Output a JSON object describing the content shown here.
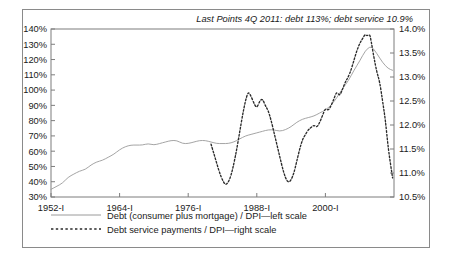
{
  "figure": {
    "title": "Last Points 4Q 2011: debt 113%; debt service 10.9%"
  },
  "chart_data": {
    "type": "line",
    "title": "Last Points 4Q 2011: debt 113%; debt service 10.9%",
    "xlabel": "",
    "ylabel": "",
    "grid": false,
    "legend_position": "bottom-left",
    "x_tick_labels": [
      "1952-I",
      "1964-I",
      "1976-I",
      "1988-I",
      "2000-I"
    ],
    "x_tick_years": [
      1952,
      1964,
      1976,
      1988,
      2000
    ],
    "xlim": [
      1952,
      2012
    ],
    "left_axis": {
      "label": "Debt (consumer plus mortgage) / DPI",
      "ylim": [
        30,
        140
      ],
      "tick_labels": [
        "30%",
        "40%",
        "50%",
        "60%",
        "70%",
        "80%",
        "90%",
        "100%",
        "110%",
        "120%",
        "130%",
        "140%"
      ],
      "ticks": [
        30,
        40,
        50,
        60,
        70,
        80,
        90,
        100,
        110,
        120,
        130,
        140
      ]
    },
    "right_axis": {
      "label": "Debt service payments / DPI",
      "ylim": [
        10.5,
        14.0
      ],
      "tick_labels": [
        "10.5%",
        "11.0%",
        "11.5%",
        "12.0%",
        "12.5%",
        "13.0%",
        "13.5%",
        "14.0%"
      ],
      "ticks": [
        10.5,
        11.0,
        11.5,
        12.0,
        12.5,
        13.0,
        13.5,
        14.0
      ]
    },
    "series": [
      {
        "name": "Debt (consumer plus mortgage) / DPI—left scale",
        "axis": "left",
        "style": "solid",
        "color": "#9a9a9a",
        "x": [
          1952,
          1953,
          1954,
          1955,
          1956,
          1957,
          1958,
          1959,
          1960,
          1961,
          1962,
          1963,
          1964,
          1965,
          1966,
          1967,
          1968,
          1969,
          1970,
          1971,
          1972,
          1973,
          1974,
          1975,
          1976,
          1977,
          1978,
          1979,
          1980,
          1981,
          1982,
          1983,
          1984,
          1985,
          1986,
          1987,
          1988,
          1989,
          1990,
          1991,
          1992,
          1993,
          1994,
          1995,
          1996,
          1997,
          1998,
          1999,
          2000,
          2001,
          2002,
          2003,
          2004,
          2005,
          2006,
          2007,
          2008,
          2009,
          2010,
          2011,
          2011.75
        ],
        "values": [
          35,
          37,
          39,
          43,
          45,
          47,
          48,
          51,
          53,
          54,
          56,
          58,
          61,
          63,
          64,
          64,
          64,
          65,
          64,
          65,
          66,
          67,
          67,
          65,
          65,
          66,
          67,
          67,
          66,
          65,
          65,
          65,
          66,
          68,
          70,
          71,
          72,
          73,
          74,
          74,
          73,
          74,
          76,
          79,
          81,
          82,
          83,
          85,
          87,
          90,
          95,
          101,
          106,
          113,
          119,
          126,
          129,
          124,
          118,
          114,
          113
        ]
      },
      {
        "name": "Debt service payments / DPI—right scale",
        "axis": "right",
        "style": "dashed",
        "color": "#2a2a2a",
        "x": [
          1980,
          1980.5,
          1981,
          1981.5,
          1982,
          1982.5,
          1983,
          1983.5,
          1984,
          1984.5,
          1985,
          1985.5,
          1986,
          1986.5,
          1987,
          1987.5,
          1988,
          1988.5,
          1989,
          1989.5,
          1990,
          1990.5,
          1991,
          1991.5,
          1992,
          1992.5,
          1993,
          1993.5,
          1994,
          1994.5,
          1995,
          1995.5,
          1996,
          1996.5,
          1997,
          1997.5,
          1998,
          1998.5,
          1999,
          1999.5,
          2000,
          2000.5,
          2001,
          2001.5,
          2002,
          2002.5,
          2003,
          2003.5,
          2004,
          2004.5,
          2005,
          2005.5,
          2006,
          2006.5,
          2007,
          2007.25,
          2007.75,
          2008,
          2008.5,
          2009,
          2009.5,
          2010,
          2010.5,
          2011,
          2011.75
        ],
        "values": [
          11.6,
          11.4,
          11.2,
          11.0,
          10.85,
          10.75,
          10.8,
          10.95,
          11.2,
          11.5,
          11.85,
          12.2,
          12.5,
          12.7,
          12.6,
          12.45,
          12.35,
          12.5,
          12.55,
          12.4,
          12.3,
          12.1,
          11.85,
          11.6,
          11.35,
          11.1,
          10.9,
          10.8,
          10.85,
          11.0,
          11.25,
          11.5,
          11.7,
          11.8,
          11.9,
          11.95,
          12.0,
          11.95,
          12.05,
          12.2,
          12.35,
          12.3,
          12.4,
          12.55,
          12.7,
          12.6,
          12.75,
          12.9,
          13.0,
          13.15,
          13.35,
          13.55,
          13.7,
          13.8,
          13.9,
          13.85,
          13.9,
          13.75,
          13.4,
          13.1,
          12.9,
          12.5,
          12.1,
          11.5,
          10.9
        ]
      }
    ],
    "annotations": [
      {
        "text": "Last Points 4Q 2011: debt 113%; debt service 10.9%",
        "position": "top-right"
      }
    ]
  },
  "legend": {
    "items": [
      {
        "label": "Debt (consumer plus mortgage) / DPI—left scale",
        "style": "solid"
      },
      {
        "label": "Debt service payments / DPI—right scale",
        "style": "dashed"
      }
    ]
  }
}
